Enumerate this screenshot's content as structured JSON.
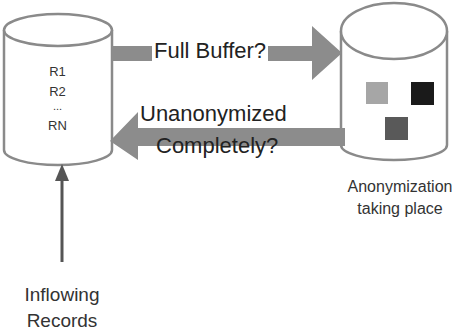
{
  "diagram": {
    "source_store": {
      "records": [
        "R1",
        "R2",
        "...",
        "RN"
      ]
    },
    "forward_arrow": {
      "label": "Full Buffer?"
    },
    "return_arrow": {
      "label_line1": "Unanonymized",
      "label_line2": "Completely?"
    },
    "anonymizer": {
      "caption_line1": "Anonymization",
      "caption_line2": "taking place",
      "blocks": [
        {
          "name": "light",
          "color": "#a6a6a6"
        },
        {
          "name": "dark",
          "color": "#1a1a1a"
        },
        {
          "name": "medium",
          "color": "#595959"
        }
      ]
    },
    "input": {
      "label_line1": "Inflowing",
      "label_line2": "Records"
    },
    "colors": {
      "outline": "#8a8a8a",
      "arrow_fill": "#8c8c8c",
      "input_arrow": "#555555"
    }
  }
}
